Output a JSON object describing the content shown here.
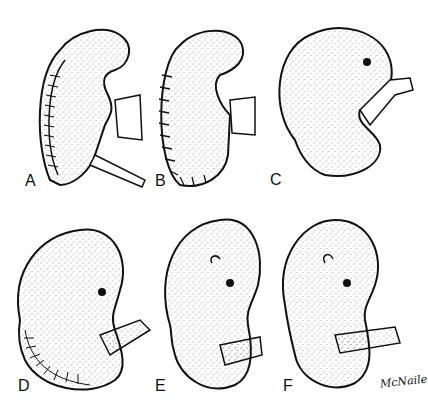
{
  "figure": {
    "panels": [
      {
        "id": "A",
        "label": "A"
      },
      {
        "id": "B",
        "label": "B"
      },
      {
        "id": "C",
        "label": "C"
      },
      {
        "id": "D",
        "label": "D"
      },
      {
        "id": "E",
        "label": "E"
      },
      {
        "id": "F",
        "label": "F"
      }
    ],
    "signature": "McNaile"
  }
}
